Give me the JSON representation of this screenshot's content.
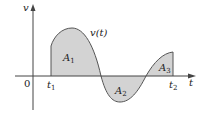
{
  "figure": {
    "axis_labels": {
      "y": "v",
      "x": "t",
      "origin": "0"
    },
    "tick_labels": {
      "t1": "t",
      "t1_sub": "1",
      "t2": "t",
      "t2_sub": "2"
    },
    "curve_label": "v(t)",
    "area_labels": [
      {
        "main": "A",
        "sub": "1"
      },
      {
        "main": "A",
        "sub": "2"
      },
      {
        "main": "A",
        "sub": "3"
      }
    ]
  },
  "colors": {
    "fill": "#d3d3d3",
    "stroke": "#555555",
    "axis": "#444444"
  }
}
